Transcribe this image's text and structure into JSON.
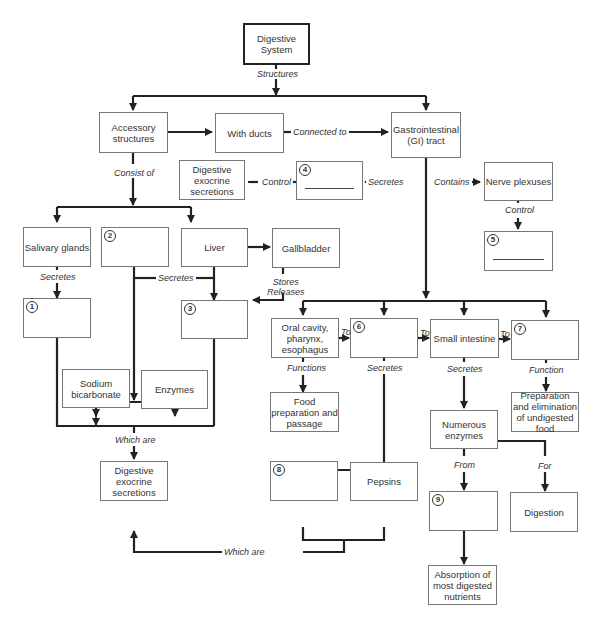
{
  "nodes": {
    "digestive_system": "Digestive System",
    "accessory_structures": "Accessory structures",
    "with_ducts": "With ducts",
    "gi_tract": "Gastrointestinal (GI) tract",
    "digestive_exocrine_secretions_top": "Digestive exocrine secretions",
    "blank4": "4",
    "nerve_plexuses": "Nerve plexuses",
    "blank5": "5",
    "salivary_glands": "Salivary glands",
    "blank2": "2",
    "liver": "Liver",
    "gallbladder": "Gallbladder",
    "blank1": "1",
    "blank3": "3",
    "oral_cavity": "Oral cavity, pharynx, esophagus",
    "blank6": "6",
    "small_intestine": "Small intestine",
    "blank7": "7",
    "sodium_bicarbonate": "Sodium bicarbonate",
    "enzymes": "Enzymes",
    "food_preparation": "Food preparation and passage",
    "preparation_elimination": "Preparation and elimination of undigested food",
    "numerous_enzymes": "Numerous enzymes",
    "digestive_exocrine_secretions_bottom": "Digestive exocrine secretions",
    "blank8": "8",
    "pepsins": "Pepsins",
    "blank9": "9",
    "digestion": "Digestion",
    "absorption": "Absorption of most digested nutrients"
  },
  "labels": {
    "structures": "Structures",
    "connected_to": "Connected to",
    "consist_of": "Consist of",
    "control_left": "Control",
    "secretes_gi": "Secretes",
    "contains": "Contains",
    "control_nerve": "Control",
    "secretes_salivary": "Secretes",
    "secretes_mid": "Secretes",
    "stores_releases": "Stores\nReleases",
    "to1": "To",
    "to2": "To",
    "to3": "To",
    "functions": "Functions",
    "secretes_stomach": "Secretes",
    "secretes_si": "Secretes",
    "function": "Function",
    "which_are_left": "Which are",
    "which_are_bottom": "Which are",
    "from": "From",
    "for": "For"
  }
}
